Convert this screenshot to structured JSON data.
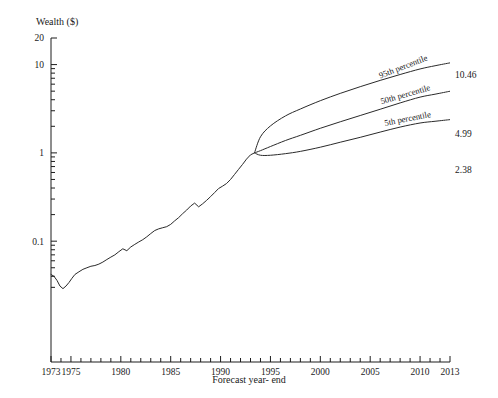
{
  "chart_data": {
    "type": "line",
    "title": "",
    "xlabel": "Forecast year- end",
    "ylabel": "Wealth ($)",
    "yscale": "log",
    "ylim": [
      0.025,
      20
    ],
    "xlim": [
      1973,
      2013
    ],
    "grid": false,
    "legend": "inline-annotations",
    "y_tick_labels": [
      "20",
      "10",
      "1",
      "0.1"
    ],
    "y_tick_values": [
      20,
      10,
      1,
      0.1
    ],
    "x_tick_labels": [
      "1973",
      "1975",
      "1980",
      "1985",
      "1990",
      "1995",
      "2000",
      "2005",
      "2010",
      "2013"
    ],
    "x_tick_values": [
      1973,
      1975,
      1980,
      1985,
      1990,
      1995,
      2000,
      2005,
      2010,
      2013
    ],
    "series": [
      {
        "name": "Historical wealth",
        "kind": "historical",
        "x": [
          1973.0,
          1973.3,
          1973.6,
          1973.9,
          1974.2,
          1974.5,
          1974.8,
          1975.1,
          1975.4,
          1975.8,
          1976.2,
          1976.6,
          1977.0,
          1977.4,
          1977.8,
          1978.2,
          1978.6,
          1979.0,
          1979.4,
          1979.8,
          1980.2,
          1980.6,
          1981.0,
          1981.4,
          1981.8,
          1982.2,
          1982.6,
          1983.0,
          1983.4,
          1983.8,
          1984.2,
          1984.6,
          1985.0,
          1985.4,
          1985.8,
          1986.2,
          1986.6,
          1987.0,
          1987.4,
          1987.8,
          1988.2,
          1988.6,
          1989.0,
          1989.4,
          1989.8,
          1990.2,
          1990.6,
          1991.0,
          1991.4,
          1991.8,
          1992.2,
          1992.6,
          1993.0,
          1993.4
        ],
        "y": [
          0.042,
          0.04,
          0.036,
          0.031,
          0.029,
          0.031,
          0.034,
          0.038,
          0.042,
          0.045,
          0.048,
          0.05,
          0.052,
          0.053,
          0.055,
          0.058,
          0.062,
          0.066,
          0.07,
          0.076,
          0.082,
          0.078,
          0.086,
          0.092,
          0.098,
          0.104,
          0.112,
          0.122,
          0.132,
          0.138,
          0.142,
          0.146,
          0.155,
          0.17,
          0.185,
          0.205,
          0.225,
          0.25,
          0.27,
          0.245,
          0.265,
          0.29,
          0.32,
          0.355,
          0.395,
          0.42,
          0.45,
          0.5,
          0.57,
          0.65,
          0.74,
          0.85,
          0.95,
          1.0
        ]
      },
      {
        "name": "95th percentile",
        "kind": "forecast",
        "label": "95th percentile",
        "end_value": "10.46",
        "end_value_numeric": 10.46,
        "x": [
          1993.4,
          1994.0,
          1995.0,
          1996.5,
          1998.0,
          2000.0,
          2002.0,
          2004.0,
          2006.0,
          2008.0,
          2010.0,
          2011.5,
          2013.0
        ],
        "y": [
          1.0,
          1.52,
          2.02,
          2.62,
          3.14,
          3.9,
          4.72,
          5.62,
          6.62,
          7.72,
          8.92,
          9.7,
          10.46
        ]
      },
      {
        "name": "50th percentile",
        "kind": "forecast",
        "label": "50th percentile",
        "end_value": "4.99",
        "end_value_numeric": 4.99,
        "x": [
          1993.4,
          1994.0,
          1995.0,
          1996.5,
          1998.0,
          2000.0,
          2002.0,
          2004.0,
          2006.0,
          2008.0,
          2010.0,
          2011.5,
          2013.0
        ],
        "y": [
          1.0,
          1.06,
          1.18,
          1.38,
          1.58,
          1.9,
          2.25,
          2.65,
          3.12,
          3.68,
          4.28,
          4.62,
          4.99
        ]
      },
      {
        "name": "5th percentile",
        "kind": "forecast",
        "label": "5th percentile",
        "end_value": "2.38",
        "end_value_numeric": 2.38,
        "x": [
          1993.4,
          1994.0,
          1995.0,
          1996.5,
          1998.0,
          2000.0,
          2002.0,
          2004.0,
          2006.0,
          2008.0,
          2010.0,
          2011.5,
          2013.0
        ],
        "y": [
          1.0,
          0.94,
          0.94,
          0.98,
          1.04,
          1.16,
          1.32,
          1.5,
          1.72,
          1.96,
          2.18,
          2.28,
          2.38
        ]
      }
    ]
  },
  "annotations": {
    "p95_label": "95th percentile",
    "p50_label": "50th percentile",
    "p05_label": "5th percentile",
    "p95_value": "10.46",
    "p50_value": "4.99",
    "p05_value": "2.38"
  },
  "axes": {
    "y_title": "Wealth ($)",
    "x_title": "Forecast year- end",
    "y_labels": [
      "20",
      "10",
      "1",
      "0.1"
    ],
    "x_labels": [
      "1973",
      "1975",
      "1980",
      "1985",
      "1990",
      "1995",
      "2000",
      "2005",
      "2010",
      "2013"
    ]
  }
}
